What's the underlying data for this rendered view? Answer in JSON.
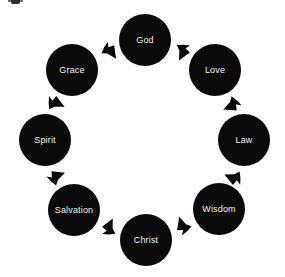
{
  "diagram": {
    "type": "cycle",
    "direction": "clockwise",
    "background_color": "#ffffff",
    "node_color": "#090909",
    "label_color": "#f2f2f2",
    "arrow_color": "#090909",
    "nodes": [
      {
        "label": "God",
        "cx": 145,
        "cy": 40,
        "r": 26,
        "angle_deg": 270
      },
      {
        "label": "Love",
        "cx": 215,
        "cy": 70,
        "r": 26,
        "angle_deg": 315
      },
      {
        "label": "Law",
        "cx": 244,
        "cy": 140,
        "r": 26,
        "angle_deg": 0
      },
      {
        "label": "Wisdom",
        "cx": 219,
        "cy": 209,
        "r": 26,
        "angle_deg": 45
      },
      {
        "label": "Christ",
        "cx": 146,
        "cy": 240,
        "r": 26,
        "angle_deg": 90
      },
      {
        "label": "Salvation",
        "cx": 74,
        "cy": 210,
        "r": 26,
        "angle_deg": 135
      },
      {
        "label": "Spirit",
        "cx": 45,
        "cy": 140,
        "r": 26,
        "angle_deg": 180
      },
      {
        "label": "Grace",
        "cx": 72,
        "cy": 70,
        "r": 26,
        "angle_deg": 225
      }
    ],
    "arrows": [
      {
        "from": "Grace",
        "to": "God",
        "cx": 110,
        "cy": 52,
        "rot": 48
      },
      {
        "from": "God",
        "to": "Love",
        "cx": 182,
        "cy": 52,
        "rot": 110
      },
      {
        "from": "Love",
        "to": "Law",
        "cx": 231,
        "cy": 105,
        "rot": 150
      },
      {
        "from": "Law",
        "to": "Wisdom",
        "cx": 233,
        "cy": 177,
        "rot": 196
      },
      {
        "from": "Wisdom",
        "to": "Christ",
        "cx": 183,
        "cy": 225,
        "rot": 245
      },
      {
        "from": "Christ",
        "to": "Salvation",
        "cx": 110,
        "cy": 227,
        "rot": 288
      },
      {
        "from": "Salvation",
        "to": "Spirit",
        "cx": 57,
        "cy": 177,
        "rot": 332
      },
      {
        "from": "Spirit",
        "to": "Grace",
        "cx": 56,
        "cy": 104,
        "rot": 18
      }
    ]
  }
}
